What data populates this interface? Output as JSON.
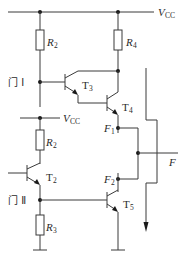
{
  "diagram": {
    "type": "circuit-schematic",
    "supply": {
      "top_label": "V",
      "top_label_sub": "CC",
      "mid_label": "V",
      "mid_label_sub": "CC"
    },
    "resistors": [
      {
        "id": "R2_top",
        "label": "R",
        "sub": "2"
      },
      {
        "id": "R4",
        "label": "R",
        "sub": "4"
      },
      {
        "id": "R2_bottom",
        "label": "R",
        "sub": "2"
      },
      {
        "id": "R3",
        "label": "R",
        "sub": "3"
      }
    ],
    "transistors": [
      {
        "id": "T3",
        "label": "T",
        "sub": "3"
      },
      {
        "id": "T4",
        "label": "T",
        "sub": "4"
      },
      {
        "id": "T2",
        "label": "T",
        "sub": "2"
      },
      {
        "id": "T5",
        "label": "T",
        "sub": "5"
      }
    ],
    "gates": [
      {
        "id": "gate1",
        "label": "门 Ⅰ"
      },
      {
        "id": "gate2",
        "label": "门 Ⅱ"
      }
    ],
    "nodes": [
      {
        "id": "F1",
        "label": "F",
        "sub": "1"
      },
      {
        "id": "F2",
        "label": "F",
        "sub": "2"
      },
      {
        "id": "F",
        "label": "F"
      }
    ],
    "colors": {
      "line": "#3a3a3a",
      "dot": "#1a1a1a",
      "background": "#ffffff"
    }
  }
}
